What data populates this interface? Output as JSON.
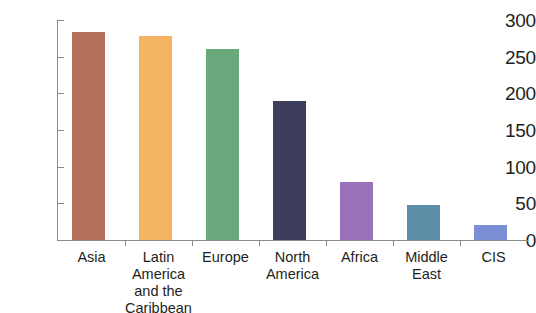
{
  "chart_data": {
    "type": "bar",
    "title": "",
    "subtitle": "",
    "xlabel": "",
    "ylabel": "",
    "ylim": [
      0,
      300
    ],
    "yticks": [
      0,
      50,
      100,
      150,
      200,
      250,
      300
    ],
    "ytick_labels": [
      "0",
      "50",
      "100",
      "150",
      "200",
      "250",
      "300"
    ],
    "grid": false,
    "legend": "none",
    "categories": [
      "Asia",
      "Latin\nAmerica\nand the\nCaribbean",
      "Europe",
      "North\nAmerica",
      "Africa",
      "Middle East",
      "CIS"
    ],
    "values": [
      283,
      278,
      260,
      189,
      79,
      48,
      20
    ],
    "colors": [
      "#b5705c",
      "#f5b463",
      "#6aa97c",
      "#3c3e5c",
      "#9a72bc",
      "#5b8fa8",
      "#7a8fd4"
    ],
    "axis_color": "#8b8b8b",
    "background": "#ffffff"
  }
}
